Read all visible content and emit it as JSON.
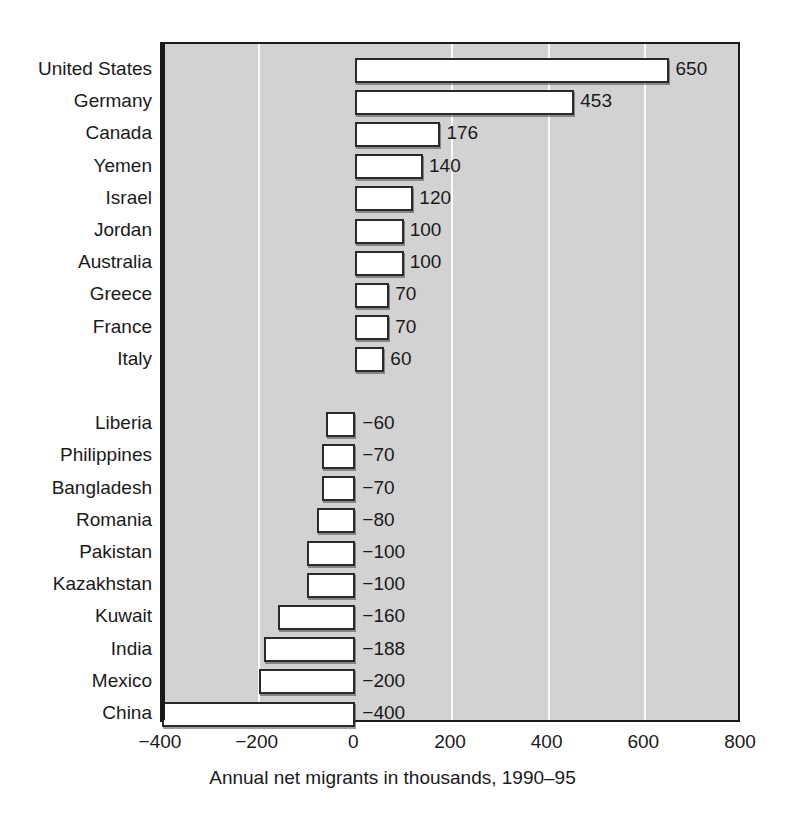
{
  "chart_data": {
    "type": "bar",
    "orientation": "horizontal",
    "title": "",
    "xlabel": "Annual net migrants in thousands, 1990–95",
    "ylabel": "",
    "xlim": [
      -400,
      800
    ],
    "xticks": [
      -400,
      -200,
      0,
      200,
      400,
      600,
      800
    ],
    "xticklabels": [
      "−400",
      "−200",
      "0",
      "200",
      "400",
      "600",
      "800"
    ],
    "grid": true,
    "grid_axis": "x",
    "legend": "none",
    "categories": [
      "United States",
      "Germany",
      "Canada",
      "Yemen",
      "Israel",
      "Jordan",
      "Australia",
      "Greece",
      "France",
      "Italy",
      "Liberia",
      "Philippines",
      "Bangladesh",
      "Romania",
      "Pakistan",
      "Kazakhstan",
      "Kuwait",
      "India",
      "Mexico",
      "China"
    ],
    "values": [
      650,
      453,
      176,
      140,
      120,
      100,
      100,
      70,
      70,
      60,
      -60,
      -70,
      -70,
      -80,
      -100,
      -100,
      -160,
      -188,
      -200,
      -400
    ],
    "value_labels": [
      "650",
      "453",
      "176",
      "140",
      "120",
      "100",
      "100",
      "70",
      "70",
      "60",
      "−60",
      "−70",
      "−70",
      "−80",
      "−100",
      "−100",
      "−160",
      "−188",
      "−200",
      "−400"
    ],
    "gap_after_index": 9,
    "colors": {
      "plot_background": "#d2d2d2",
      "bar_fill": "#ffffff",
      "bar_edge": "#2a2a2a",
      "gridline": "#fbfbfb",
      "axis": "#1a1a1a",
      "text": "#1a1a1a",
      "page_background": "#ffffff"
    }
  }
}
